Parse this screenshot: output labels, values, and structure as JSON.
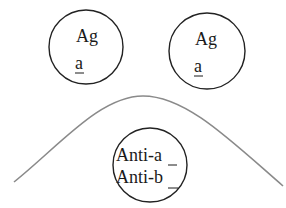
{
  "diagram": {
    "antigens": [
      {
        "line1": "Ag",
        "line2": "a"
      },
      {
        "line1": "Ag",
        "line2": "a"
      }
    ],
    "antibody": {
      "line1_prefix": "Anti-",
      "line1_suffix": "a",
      "line2_prefix": "Anti-",
      "line2_suffix": "b"
    },
    "colors": {
      "circle_stroke": "#222222",
      "curve_stroke": "#8a8a8a",
      "text": "#1a1a1a"
    }
  }
}
